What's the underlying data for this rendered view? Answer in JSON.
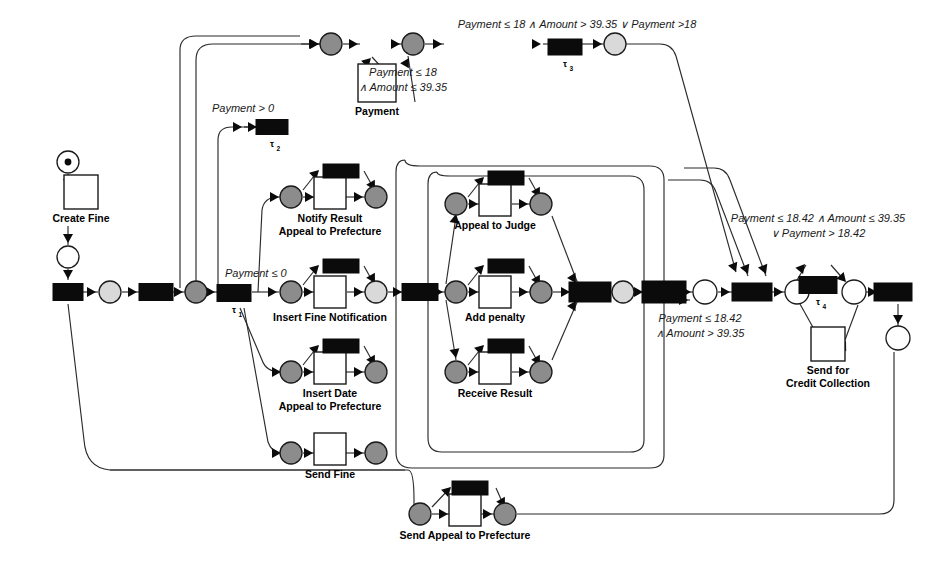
{
  "diagram": {
    "type": "petri-net",
    "colors": {
      "line": "#2b2b2b",
      "transition_fill": "#0b0b0b",
      "place_stroke": "#1a1a1a",
      "place_white": "#ffffff",
      "place_gray": "#8c8c8c",
      "place_light": "#d9d9d9",
      "task_fill": "#ffffff",
      "background": "#ffffff"
    },
    "tasks": [
      {
        "id": "create-fine",
        "label": "Create Fine",
        "x": 81,
        "y": 192,
        "w": 34,
        "h": 34
      },
      {
        "id": "payment",
        "label": "Payment",
        "x": 377,
        "y": 83,
        "w": 38,
        "h": 38
      },
      {
        "id": "notify-result-appeal-to-prefecture",
        "label_line1": "Notify Result",
        "label_line2": "Appeal to Prefecture",
        "x": 330,
        "y": 193,
        "w": 32,
        "h": 32
      },
      {
        "id": "insert-fine-notification",
        "label_line1": "Insert Fine Notification",
        "label_line2": "",
        "x": 330,
        "y": 292,
        "w": 32,
        "h": 32
      },
      {
        "id": "insert-date-appeal-to-prefecture",
        "label_line1": "Insert Date",
        "label_line2": "Appeal to Prefecture",
        "x": 330,
        "y": 368,
        "w": 32,
        "h": 32
      },
      {
        "id": "send-fine",
        "label_line1": "Send Fine",
        "label_line2": "",
        "x": 330,
        "y": 449,
        "w": 32,
        "h": 32
      },
      {
        "id": "send-appeal-to-prefecture",
        "label_line1": "Send Appeal to Prefecture",
        "label_line2": "",
        "x": 465,
        "y": 510,
        "w": 32,
        "h": 32
      },
      {
        "id": "appeal-to-judge",
        "label": "Appeal to Judge",
        "x": 495,
        "y": 200,
        "w": 32,
        "h": 32
      },
      {
        "id": "add-penalty",
        "label": "Add penalty",
        "x": 495,
        "y": 292,
        "w": 32,
        "h": 32
      },
      {
        "id": "receive-result",
        "label": "Receive Result",
        "x": 495,
        "y": 368,
        "w": 32,
        "h": 32
      },
      {
        "id": "send-for-credit-collection",
        "label_line1": "Send for",
        "label_line2": "Credit Collection",
        "x": 828,
        "y": 344,
        "w": 34,
        "h": 34
      }
    ],
    "silent_transitions": [
      {
        "id": "tau-1",
        "label": "τ",
        "sub": "1",
        "x": 234,
        "y": 293
      },
      {
        "id": "tau-2",
        "label": "τ",
        "sub": "2",
        "x": 272,
        "y": 127
      },
      {
        "id": "tau-3",
        "label": "τ",
        "sub": "3",
        "x": 565,
        "y": 47
      },
      {
        "id": "tau-4",
        "label": "τ",
        "sub": "4",
        "x": 818,
        "y": 285
      }
    ],
    "conditions": [
      {
        "id": "cond-payment-gt-0",
        "text": "Payment > 0",
        "x": 243,
        "y": 112,
        "align": "middle"
      },
      {
        "id": "cond-payment-le-0",
        "text": "Payment ≤ 0",
        "x": 225,
        "y": 277,
        "align": "start"
      },
      {
        "id": "cond-payment-le-18-top",
        "line1": "Payment ≤ 18",
        "line2": "∧ Amount ≤ 39.35",
        "x": 403,
        "y": 76
      },
      {
        "id": "cond-tau3",
        "text": "Payment ≤ 18 ∧ Amount > 39.35 ∨ Payment >18",
        "x": 577,
        "y": 28,
        "align": "middle"
      },
      {
        "id": "cond-tau4",
        "line1": "Payment ≤ 18.42 ∧ Amount ≤ 39.35",
        "line2": "∨ Payment > 18.42",
        "x": 818,
        "y": 222
      },
      {
        "id": "cond-credit-collection",
        "line1": "Payment ≤ 18.42",
        "line2": "∧ Amount > 39.35",
        "x": 700,
        "y": 322
      }
    ],
    "places": [
      {
        "id": "start-place",
        "x": 68,
        "y": 162,
        "r": 11,
        "fill": "white",
        "token": true
      },
      {
        "id": "place-after-create-fine",
        "x": 68,
        "y": 257,
        "r": 11,
        "fill": "white",
        "token": false
      },
      {
        "id": "place-p1",
        "x": 110,
        "y": 292,
        "r": 11,
        "fill": "light",
        "token": false
      },
      {
        "id": "place-p2",
        "x": 196,
        "y": 292,
        "r": 11,
        "fill": "gray",
        "token": false
      },
      {
        "id": "place-payment-in",
        "x": 331,
        "y": 44,
        "r": 11,
        "fill": "gray",
        "token": false
      },
      {
        "id": "place-payment-out",
        "x": 413,
        "y": 44,
        "r": 11,
        "fill": "gray",
        "token": false
      },
      {
        "id": "place-tau3-out",
        "x": 615,
        "y": 44,
        "r": 11,
        "fill": "light",
        "token": false
      },
      {
        "id": "place-nr-in",
        "x": 291,
        "y": 197,
        "r": 11,
        "fill": "gray",
        "token": false
      },
      {
        "id": "place-nr-out",
        "x": 376,
        "y": 197,
        "r": 11,
        "fill": "gray",
        "token": false
      },
      {
        "id": "place-ifn-in",
        "x": 291,
        "y": 292,
        "r": 11,
        "fill": "gray",
        "token": false
      },
      {
        "id": "place-ifn-out",
        "x": 376,
        "y": 292,
        "r": 11,
        "fill": "light",
        "token": false
      },
      {
        "id": "place-ida-in",
        "x": 291,
        "y": 372,
        "r": 11,
        "fill": "gray",
        "token": false
      },
      {
        "id": "place-ida-out",
        "x": 376,
        "y": 372,
        "r": 11,
        "fill": "gray",
        "token": false
      },
      {
        "id": "place-sf-in",
        "x": 291,
        "y": 453,
        "r": 11,
        "fill": "gray",
        "token": false
      },
      {
        "id": "place-sf-out",
        "x": 376,
        "y": 453,
        "r": 11,
        "fill": "gray",
        "token": false
      },
      {
        "id": "place-sap-in",
        "x": 420,
        "y": 514,
        "r": 11,
        "fill": "gray",
        "token": false
      },
      {
        "id": "place-sap-out",
        "x": 505,
        "y": 514,
        "r": 11,
        "fill": "gray",
        "token": false
      },
      {
        "id": "place-aj-in",
        "x": 456,
        "y": 204,
        "r": 11,
        "fill": "gray",
        "token": false
      },
      {
        "id": "place-aj-out",
        "x": 541,
        "y": 204,
        "r": 11,
        "fill": "gray",
        "token": false
      },
      {
        "id": "place-ap-in",
        "x": 456,
        "y": 292,
        "r": 11,
        "fill": "gray",
        "token": false
      },
      {
        "id": "place-ap-out",
        "x": 541,
        "y": 292,
        "r": 11,
        "fill": "gray",
        "token": false
      },
      {
        "id": "place-rr-in",
        "x": 456,
        "y": 372,
        "r": 11,
        "fill": "gray",
        "token": false
      },
      {
        "id": "place-rr-out",
        "x": 541,
        "y": 372,
        "r": 11,
        "fill": "gray",
        "token": false
      },
      {
        "id": "place-mid-join",
        "x": 623,
        "y": 292,
        "r": 11,
        "fill": "light",
        "token": false
      },
      {
        "id": "place-after-join",
        "x": 705,
        "y": 292,
        "r": 12,
        "fill": "white",
        "token": false
      },
      {
        "id": "place-tau4-in",
        "x": 797,
        "y": 292,
        "r": 12,
        "fill": "white",
        "token": false
      },
      {
        "id": "place-tau4-out",
        "x": 854,
        "y": 292,
        "r": 12,
        "fill": "white",
        "token": false
      },
      {
        "id": "place-end",
        "x": 898,
        "y": 338,
        "r": 12,
        "fill": "white",
        "token": false
      }
    ]
  }
}
